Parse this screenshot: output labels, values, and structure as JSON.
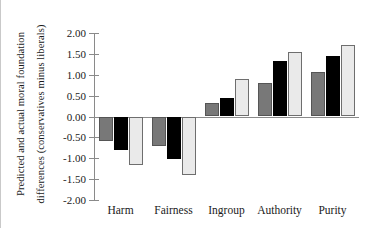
{
  "chart_data": {
    "type": "bar",
    "title": "",
    "xlabel": "",
    "ylabel": "Predicted and actual moral foundation differences (conservatives minus liberals)",
    "ylabel_lines": [
      "Predicted and actual moral foundation",
      "differences (conservatives minus liberals)"
    ],
    "categories": [
      "Harm",
      "Fairness",
      "Ingroup",
      "Authority",
      "Purity"
    ],
    "series": [
      {
        "name": "series-1",
        "color": "#787878",
        "values": [
          -0.58,
          -0.71,
          0.33,
          0.81,
          1.06
        ]
      },
      {
        "name": "series-2",
        "color": "#000000",
        "values": [
          -0.81,
          -1.02,
          0.44,
          1.33,
          1.46
        ]
      },
      {
        "name": "series-3",
        "color": "#eaeaea",
        "values": [
          -1.17,
          -1.41,
          0.89,
          1.54,
          1.72
        ]
      }
    ],
    "ylim": [
      -2.0,
      2.0
    ],
    "yticks": [
      2.0,
      1.5,
      1.0,
      0.5,
      0.0,
      -0.5,
      -1.0,
      -1.5,
      -2.0
    ],
    "ytick_labels": [
      "2.00",
      "1.50",
      "1.00",
      "0.50",
      "0.00",
      "-0.50",
      "-1.00",
      "-1.50",
      "-2.00"
    ],
    "grid": false,
    "legend": "none",
    "zero_line": true
  },
  "colors": {
    "axis": "#8a8a8a",
    "text": "#1a1a1a",
    "background": "#ffffff",
    "frame_border": "#c9c9c9"
  }
}
